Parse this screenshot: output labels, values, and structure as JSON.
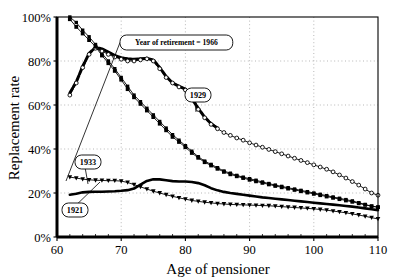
{
  "chart_data": {
    "type": "line",
    "title": "",
    "xlabel": "Age of pensioner",
    "ylabel": "Replacement rate",
    "xlim": [
      60,
      110
    ],
    "ylim": [
      0,
      1.0
    ],
    "xticks": [
      60,
      70,
      80,
      90,
      100,
      110
    ],
    "xtick_labels": [
      "60",
      "70",
      "80",
      "90",
      "100",
      "110"
    ],
    "yticks": [
      0,
      0.2,
      0.4,
      0.6,
      0.8,
      1.0
    ],
    "ytick_labels": [
      "0%",
      "20%",
      "40%",
      "60%",
      "80%",
      "100%"
    ],
    "grid": true,
    "grid_style": "dotted",
    "legend_position": "inline-callouts",
    "annotations": [
      {
        "id": "ann-1966",
        "text": "Year of retirement = 1966",
        "series": "1966",
        "x": 120,
        "y": 35,
        "point_x": 66,
        "point_y": 181
      },
      {
        "id": "ann-1929",
        "text": "1929",
        "series": "1929",
        "x": 185,
        "y": 88,
        "point_x": 196,
        "point_y": 112
      },
      {
        "id": "ann-1933",
        "text": "1933",
        "series": "1933",
        "x": 75,
        "y": 155,
        "point_x": 88,
        "point_y": 184
      },
      {
        "id": "ann-1921",
        "text": "1921",
        "series": "1921",
        "x": 62,
        "y": 203,
        "point_x": 100,
        "point_y": 182
      }
    ],
    "series": [
      {
        "name": "1966",
        "marker": "square-small",
        "line": "thin",
        "x": [
          62,
          63,
          64,
          65,
          66,
          67,
          68,
          69,
          70,
          71,
          72,
          73,
          74,
          75,
          76,
          77,
          78,
          79,
          80,
          81,
          82,
          83,
          84,
          85,
          86,
          87,
          88,
          89,
          90,
          91,
          92,
          93,
          94,
          95,
          96,
          97,
          98,
          99,
          100,
          101,
          102,
          103,
          104,
          105,
          106,
          107,
          108,
          109,
          110
        ],
        "values": [
          1.0,
          0.975,
          0.94,
          0.91,
          0.875,
          0.835,
          0.8,
          0.765,
          0.725,
          0.685,
          0.645,
          0.615,
          0.585,
          0.555,
          0.525,
          0.495,
          0.465,
          0.44,
          0.415,
          0.39,
          0.365,
          0.345,
          0.33,
          0.315,
          0.3,
          0.29,
          0.28,
          0.272,
          0.265,
          0.258,
          0.25,
          0.243,
          0.236,
          0.23,
          0.224,
          0.218,
          0.212,
          0.206,
          0.2,
          0.194,
          0.188,
          0.182,
          0.176,
          0.17,
          0.164,
          0.156,
          0.148,
          0.14,
          0.135
        ]
      },
      {
        "name": "1929-thick",
        "marker": "none",
        "line": "thick-dash",
        "x": [
          62,
          63,
          64,
          65,
          66,
          67,
          68,
          69,
          70,
          71,
          72,
          73,
          74,
          75,
          76,
          77,
          78,
          79,
          80,
          81,
          82,
          83,
          84,
          85
        ],
        "values": [
          0.655,
          0.705,
          0.775,
          0.835,
          0.862,
          0.855,
          0.84,
          0.825,
          0.815,
          0.81,
          0.808,
          0.81,
          0.812,
          0.805,
          0.77,
          0.73,
          0.7,
          0.685,
          0.672,
          0.63,
          0.585,
          0.545,
          0.515,
          0.495
        ]
      },
      {
        "name": "1966-circles",
        "marker": "circle-open",
        "line": "thin",
        "x": [
          62,
          63,
          64,
          65,
          66,
          67,
          68,
          69,
          70,
          71,
          72,
          73,
          74,
          75,
          76,
          77,
          78,
          79,
          80,
          81,
          82,
          83,
          84,
          85,
          86,
          87,
          88,
          89,
          90,
          91,
          92,
          93,
          94,
          95,
          96,
          97,
          98,
          99,
          100,
          101,
          102,
          103,
          104,
          105,
          106,
          107,
          108,
          109,
          110
        ],
        "values": [
          0.645,
          0.7,
          0.77,
          0.83,
          0.858,
          0.845,
          0.83,
          0.818,
          0.808,
          0.8,
          0.8,
          0.805,
          0.81,
          0.8,
          0.765,
          0.725,
          0.7,
          0.682,
          0.668,
          0.625,
          0.58,
          0.542,
          0.512,
          0.492,
          0.475,
          0.462,
          0.45,
          0.44,
          0.428,
          0.418,
          0.408,
          0.398,
          0.388,
          0.378,
          0.368,
          0.358,
          0.348,
          0.338,
          0.328,
          0.318,
          0.308,
          0.296,
          0.282,
          0.268,
          0.252,
          0.236,
          0.218,
          0.2,
          0.19
        ]
      },
      {
        "name": "1929",
        "marker": "square",
        "line": "thin",
        "x": [
          62,
          63,
          64,
          65,
          66,
          67,
          68,
          69,
          70,
          71,
          72,
          73,
          74,
          75,
          76,
          77,
          78,
          79,
          80,
          81,
          82,
          83,
          84,
          85,
          86,
          87,
          88,
          89,
          90,
          91,
          92,
          93,
          94,
          95,
          96,
          97,
          98,
          99,
          100,
          101,
          102,
          103,
          104,
          105,
          106,
          107,
          108,
          109,
          110
        ],
        "values": [
          0.99,
          0.955,
          0.925,
          0.895,
          0.865,
          0.825,
          0.79,
          0.755,
          0.715,
          0.672,
          0.635,
          0.605,
          0.575,
          0.545,
          0.515,
          0.485,
          0.455,
          0.432,
          0.408,
          0.382,
          0.36,
          0.34,
          0.325,
          0.31,
          0.296,
          0.285,
          0.276,
          0.268,
          0.26,
          0.253,
          0.246,
          0.239,
          0.232,
          0.226,
          0.22,
          0.214,
          0.208,
          0.202,
          0.196,
          0.19,
          0.184,
          0.178,
          0.172,
          0.166,
          0.16,
          0.153,
          0.146,
          0.14,
          0.136
        ]
      },
      {
        "name": "1933",
        "marker": "triangle-down",
        "line": "thin",
        "x": [
          62,
          63,
          64,
          65,
          66,
          67,
          68,
          69,
          70,
          71,
          72,
          73,
          74,
          75,
          76,
          77,
          78,
          79,
          80,
          81,
          82,
          83,
          84,
          85,
          86,
          87,
          88,
          89,
          90,
          91,
          92,
          93,
          94,
          95,
          96,
          97,
          98,
          99,
          100,
          101,
          102,
          103,
          104,
          105,
          106,
          107,
          108,
          109,
          110
        ],
        "values": [
          0.272,
          0.268,
          0.263,
          0.26,
          0.258,
          0.257,
          0.256,
          0.256,
          0.254,
          0.248,
          0.238,
          0.228,
          0.218,
          0.208,
          0.2,
          0.192,
          0.185,
          0.178,
          0.172,
          0.166,
          0.162,
          0.158,
          0.155,
          0.152,
          0.15,
          0.148,
          0.147,
          0.146,
          0.145,
          0.144,
          0.143,
          0.142,
          0.14,
          0.138,
          0.136,
          0.134,
          0.132,
          0.13,
          0.128,
          0.125,
          0.122,
          0.118,
          0.114,
          0.11,
          0.105,
          0.1,
          0.094,
          0.088,
          0.082
        ]
      },
      {
        "name": "1921",
        "marker": "none",
        "line": "thick-solid",
        "x": [
          62,
          63,
          64,
          65,
          66,
          67,
          68,
          69,
          70,
          71,
          72,
          73,
          74,
          75,
          76,
          77,
          78,
          79,
          80,
          81,
          82,
          83,
          84,
          85,
          86,
          87,
          88,
          89,
          90,
          91,
          92,
          93,
          94,
          95,
          96,
          97,
          98,
          99,
          100,
          101,
          102,
          103,
          104,
          105,
          106,
          107,
          108,
          109,
          110
        ],
        "values": [
          0.192,
          0.197,
          0.203,
          0.205,
          0.206,
          0.206,
          0.207,
          0.208,
          0.21,
          0.213,
          0.22,
          0.238,
          0.255,
          0.262,
          0.262,
          0.258,
          0.254,
          0.252,
          0.252,
          0.25,
          0.245,
          0.235,
          0.222,
          0.212,
          0.205,
          0.2,
          0.196,
          0.192,
          0.188,
          0.184,
          0.18,
          0.177,
          0.174,
          0.171,
          0.168,
          0.165,
          0.162,
          0.159,
          0.156,
          0.153,
          0.15,
          0.147,
          0.144,
          0.141,
          0.138,
          0.134,
          0.13,
          0.126,
          0.122
        ]
      }
    ]
  }
}
